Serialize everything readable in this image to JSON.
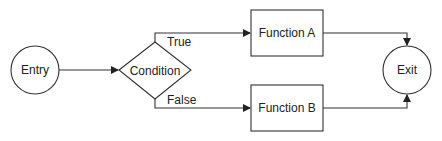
{
  "diagram": {
    "type": "flowchart",
    "nodes": {
      "entry": {
        "label": "Entry",
        "shape": "circle"
      },
      "condition": {
        "label": "Condition",
        "shape": "diamond"
      },
      "function_a": {
        "label": "Function A",
        "shape": "rectangle"
      },
      "function_b": {
        "label": "Function B",
        "shape": "rectangle"
      },
      "exit": {
        "label": "Exit",
        "shape": "circle"
      }
    },
    "edges": {
      "entry_to_condition": {
        "from": "Entry",
        "to": "Condition",
        "label": ""
      },
      "condition_true": {
        "from": "Condition",
        "to": "Function A",
        "label": "True"
      },
      "condition_false": {
        "from": "Condition",
        "to": "Function B",
        "label": "False"
      },
      "a_to_exit": {
        "from": "Function A",
        "to": "Exit",
        "label": ""
      },
      "b_to_exit": {
        "from": "Function B",
        "to": "Exit",
        "label": ""
      }
    },
    "colors": {
      "stroke": "#333333",
      "fill": "#ffffff",
      "text": "#222222"
    }
  }
}
